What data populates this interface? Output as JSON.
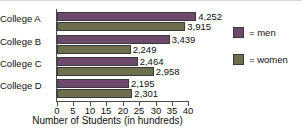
{
  "chart_data": {
    "type": "bar",
    "orientation": "horizontal",
    "title": "",
    "xlabel": "Number of Students (in hundreds)",
    "ylabel": "",
    "categories": [
      "College A",
      "College B",
      "College C",
      "College D"
    ],
    "series": [
      {
        "name": "men",
        "color": "#6d4a6b",
        "values": [
          42.52,
          34.39,
          24.64,
          21.95
        ],
        "labels": [
          "4,252",
          "3,439",
          "2,464",
          "2,195"
        ]
      },
      {
        "name": "women",
        "color": "#6e6f4c",
        "values": [
          39.15,
          22.49,
          29.58,
          23.01
        ],
        "labels": [
          "3,915",
          "2,249",
          "2,958",
          "2,301"
        ]
      }
    ],
    "xlim": [
      0,
      40
    ],
    "xticks": [
      "0",
      "5",
      "10",
      "15",
      "20",
      "25",
      "30",
      "35",
      "40"
    ],
    "grid": false,
    "legend_position": "right",
    "legend": [
      {
        "label": "= men",
        "color": "#6d4a6b"
      },
      {
        "label": "= women",
        "color": "#6e6f4c"
      }
    ]
  }
}
